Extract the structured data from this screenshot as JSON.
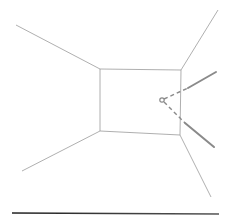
{
  "diagram": {
    "title": "",
    "colors": {
      "background": "#ffffff",
      "room_line": "#9a9a9a",
      "ray": "#8a8a8a",
      "ground_line": "#333333"
    },
    "back_wall": {
      "points": [
        [
          100,
          69
        ],
        [
          181,
          70
        ],
        [
          180,
          135
        ],
        [
          100,
          131
        ]
      ]
    },
    "perspective_edges": [
      {
        "name": "top-left",
        "from": [
          16,
          25
        ],
        "to": [
          100,
          69
        ]
      },
      {
        "name": "top-right",
        "from": [
          218,
          10
        ],
        "to": [
          181,
          70
        ]
      },
      {
        "name": "bottom-left",
        "from": [
          22,
          171
        ],
        "to": [
          100,
          131
        ]
      },
      {
        "name": "bottom-right",
        "from": [
          180,
          135
        ],
        "to": [
          211,
          197
        ]
      }
    ],
    "viewpoint": {
      "cx": 162,
      "cy": 100,
      "r": 2.2
    },
    "rays": [
      {
        "name": "upper-ray",
        "dashed_from": [
          164,
          99
        ],
        "dashed_to": [
          188,
          88
        ],
        "solid_from": [
          188,
          88
        ],
        "solid_to": [
          216,
          72
        ]
      },
      {
        "name": "lower-ray",
        "dashed_from": [
          164,
          102
        ],
        "dashed_to": [
          185,
          123
        ],
        "solid_from": [
          185,
          123
        ],
        "solid_to": [
          214,
          147
        ]
      }
    ],
    "ground_line": {
      "from": [
        12,
        213
      ],
      "to": [
        219,
        214
      ]
    }
  }
}
